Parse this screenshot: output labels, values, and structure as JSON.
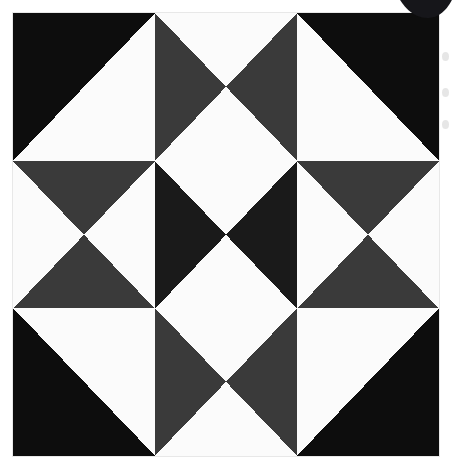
{
  "image": {
    "title": "Quilt block pattern",
    "description": "Nine-patch quilt block composed of half-square and quarter-square triangle units",
    "width": 454,
    "height": 473
  },
  "palette": {
    "background": "#ffffff",
    "fabric_light": "#fbfbfb",
    "fabric_dark": "#0d0d0d",
    "fabric_charcoal": "#3a3a3a",
    "blob": "#16161a",
    "margin_mark": "#e2e2e2"
  },
  "quilt": {
    "rows": 3,
    "columns": 3,
    "blocks": [
      {
        "position": "top-left",
        "unit": "half-square-triangle",
        "triangles": [
          {
            "name": "upper-left",
            "points": "0,0 100,0 0,100",
            "color": "#0d0d0d"
          },
          {
            "name": "lower-right",
            "points": "100,0 100,100 0,100",
            "color": "#fbfbfb"
          }
        ]
      },
      {
        "position": "top-center",
        "unit": "quarter-square-triangle",
        "triangles": [
          {
            "name": "top",
            "points": "0,0 100,0 50,50",
            "color": "#fbfbfb"
          },
          {
            "name": "right",
            "points": "100,0 100,100 50,50",
            "color": "#3a3a3a"
          },
          {
            "name": "bottom",
            "points": "100,100 0,100 50,50",
            "color": "#fbfbfb"
          },
          {
            "name": "left",
            "points": "0,100 0,0 50,50",
            "color": "#3a3a3a"
          }
        ]
      },
      {
        "position": "top-right",
        "unit": "half-square-triangle",
        "triangles": [
          {
            "name": "upper-right",
            "points": "0,0 100,0 100,100",
            "color": "#0d0d0d"
          },
          {
            "name": "lower-left",
            "points": "0,0 100,100 0,100",
            "color": "#fbfbfb"
          }
        ]
      },
      {
        "position": "middle-left",
        "unit": "quarter-square-triangle",
        "triangles": [
          {
            "name": "top",
            "points": "0,0 100,0 50,50",
            "color": "#3a3a3a"
          },
          {
            "name": "right",
            "points": "100,0 100,100 50,50",
            "color": "#fbfbfb"
          },
          {
            "name": "bottom",
            "points": "100,100 0,100 50,50",
            "color": "#3a3a3a"
          },
          {
            "name": "left",
            "points": "0,100 0,0 50,50",
            "color": "#fbfbfb"
          }
        ]
      },
      {
        "position": "middle-center",
        "unit": "quarter-square-triangle",
        "triangles": [
          {
            "name": "top",
            "points": "0,0 100,0 50,50",
            "color": "#fbfbfb"
          },
          {
            "name": "right",
            "points": "100,0 100,100 50,50",
            "color": "#1a1a1a"
          },
          {
            "name": "bottom",
            "points": "100,100 0,100 50,50",
            "color": "#fbfbfb"
          },
          {
            "name": "left",
            "points": "0,100 0,0 50,50",
            "color": "#1a1a1a"
          }
        ]
      },
      {
        "position": "middle-right",
        "unit": "quarter-square-triangle",
        "triangles": [
          {
            "name": "top",
            "points": "0,0 100,0 50,50",
            "color": "#3a3a3a"
          },
          {
            "name": "right",
            "points": "100,0 100,100 50,50",
            "color": "#fbfbfb"
          },
          {
            "name": "bottom",
            "points": "100,100 0,100 50,50",
            "color": "#3a3a3a"
          },
          {
            "name": "left",
            "points": "0,100 0,0 50,50",
            "color": "#fbfbfb"
          }
        ]
      },
      {
        "position": "bottom-left",
        "unit": "half-square-triangle",
        "triangles": [
          {
            "name": "lower-left",
            "points": "0,0 100,100 0,100",
            "color": "#0d0d0d"
          },
          {
            "name": "upper-right",
            "points": "0,0 100,0 100,100",
            "color": "#fbfbfb"
          }
        ]
      },
      {
        "position": "bottom-center",
        "unit": "quarter-square-triangle",
        "triangles": [
          {
            "name": "top",
            "points": "0,0 100,0 50,50",
            "color": "#fbfbfb"
          },
          {
            "name": "right",
            "points": "100,0 100,100 50,50",
            "color": "#3a3a3a"
          },
          {
            "name": "bottom",
            "points": "100,100 0,100 50,50",
            "color": "#fbfbfb"
          },
          {
            "name": "left",
            "points": "0,100 0,0 50,50",
            "color": "#3a3a3a"
          }
        ]
      },
      {
        "position": "bottom-right",
        "unit": "half-square-triangle",
        "triangles": [
          {
            "name": "lower-right",
            "points": "100,0 100,100 0,100",
            "color": "#0d0d0d"
          },
          {
            "name": "upper-left",
            "points": "0,0 100,0 0,100",
            "color": "#fbfbfb"
          }
        ]
      }
    ]
  },
  "artifacts": {
    "corner_blob": "dark-circular-sticker",
    "margin_marks": 3
  }
}
